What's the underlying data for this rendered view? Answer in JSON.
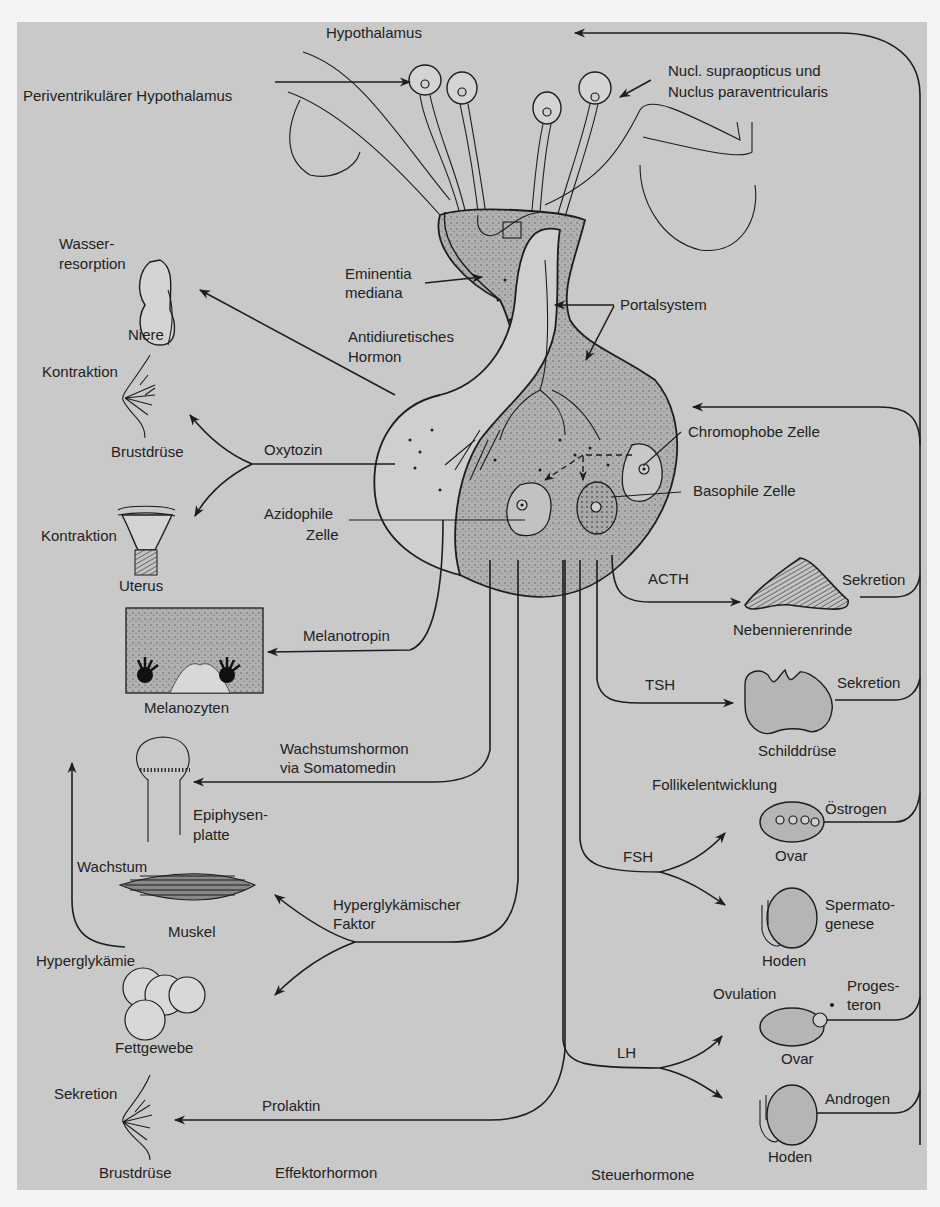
{
  "figure": {
    "background_color": "#c9c9c9",
    "line_color": "#1d1d1d",
    "top_labels": {
      "hypothalamus": "Hypothalamus",
      "periventricular": "Periventrikulärer Hypothalamus",
      "supraopticus_line1": "Nucl. supraopticus und",
      "supraopticus_line2": "Nuclus paraventricularis"
    },
    "pituitary_labels": {
      "eminentia_line1": "Eminentia",
      "eminentia_line2": "mediana",
      "portalsystem": "Portalsystem",
      "adh_line1": "Antidiuretisches",
      "adh_line2": "Hormon",
      "oxytozin": "Oxytozin",
      "chromophobe": "Chromophobe Zelle",
      "basophile": "Basophile Zelle",
      "azidophile_line1": "Azidophile",
      "azidophile_line2": "Zelle"
    },
    "effector_targets": {
      "wasserresorption_line1": "Wasser-",
      "wasserresorption_line2": "resorption",
      "niere": "Niere",
      "kontraktion_breast": "Kontraktion",
      "brustdruese_top": "Brustdrüse",
      "kontraktion_uterus": "Kontraktion",
      "uterus": "Uterus",
      "melanotropin": "Melanotropin",
      "melanozyten": "Melanozyten",
      "wachstumshormon_line1": "Wachstumshormon",
      "wachstumshormon_line2": "via Somatomedin",
      "epiphysen_line1": "Epiphysen-",
      "epiphysen_line2": "platte",
      "wachstum": "Wachstum",
      "muskel": "Muskel",
      "hyperglyk_faktor_line1": "Hyperglykämischer",
      "hyperglyk_faktor_line2": "Faktor",
      "hyperglykaemie": "Hyperglykämie",
      "fettgewebe": "Fettgewebe",
      "sekretion_breast": "Sekretion",
      "prolaktin": "Prolaktin",
      "brustdruese_bottom": "Brustdrüse",
      "effektorhormon": "Effektorhormon"
    },
    "tropic_targets": {
      "acth": "ACTH",
      "sekretion_adrenal": "Sekretion",
      "nebennierenrinde": "Nebennierenrinde",
      "tsh": "TSH",
      "sekretion_thyroid": "Sekretion",
      "schilddruese": "Schilddrüse",
      "follikelentwicklung": "Follikelentwicklung",
      "oestrogen": "Östrogen",
      "ovar_1": "Ovar",
      "fsh": "FSH",
      "spermatogenese_line1": "Spermato-",
      "spermatogenese_line2": "genese",
      "hoden_1": "Hoden",
      "ovulation": "Ovulation",
      "progesteron_line1": "Proges-",
      "progesteron_line2": "teron",
      "ovar_2": "Ovar",
      "lh": "LH",
      "androgen": "Androgen",
      "hoden_2": "Hoden",
      "steuerhormone": "Steuerhormone"
    }
  }
}
